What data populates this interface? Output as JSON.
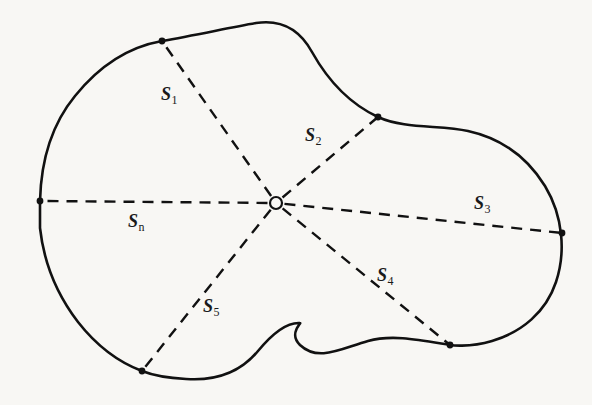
{
  "figure": {
    "background_color": "#f8f7f4",
    "outline_color": "#111111",
    "dash_color": "#111111",
    "label_color": "#1a1a1a",
    "center_point": {
      "x": 276,
      "y": 203,
      "radius": 6,
      "fill": "#f8f7f4",
      "stroke": "#111111"
    },
    "outline_path": "M 40 201 C 41 160 52 124 75 96 C 100 65 128 47 162 41 C 196 35 228 28 256 23 C 282 19 300 30 312 52 C 326 77 348 103 378 117 C 404 129 440 125 468 131 C 500 138 527 157 545 186 C 563 216 566 252 556 282 C 546 312 522 332 492 341 C 468 348 450 345 450 345 C 420 340 392 334 368 341 C 340 349 318 362 300 345 C 288 333 302 323 300 323 C 286 322 272 334 258 351 C 240 373 214 381 186 379 C 168 378 152 375 142 371 C 118 362 96 345 78 322 C 58 296 44 264 40 228 Z",
    "segments": [
      {
        "id": "s1",
        "label_symbol": "S",
        "label_subscript": "1",
        "subscript_italic": false,
        "end_x": 162,
        "end_y": 41,
        "label_x": 161,
        "label_y": 85,
        "dot": true
      },
      {
        "id": "s2",
        "label_symbol": "S",
        "label_subscript": "2",
        "subscript_italic": false,
        "end_x": 378,
        "end_y": 117,
        "label_x": 305,
        "label_y": 126,
        "dot": true
      },
      {
        "id": "s3",
        "label_symbol": "S",
        "label_subscript": "3",
        "subscript_italic": false,
        "end_x": 562,
        "end_y": 233,
        "label_x": 474,
        "label_y": 194,
        "dot": true
      },
      {
        "id": "s4",
        "label_symbol": "S",
        "label_subscript": "4",
        "subscript_italic": false,
        "end_x": 450,
        "end_y": 345,
        "label_x": 377,
        "label_y": 266,
        "dot": true
      },
      {
        "id": "s5",
        "label_symbol": "S",
        "label_subscript": "5",
        "subscript_italic": false,
        "end_x": 142,
        "end_y": 371,
        "label_x": 203,
        "label_y": 297,
        "dot": true
      },
      {
        "id": "sn",
        "label_symbol": "S",
        "label_subscript": "n",
        "subscript_italic": false,
        "end_x": 40,
        "end_y": 201,
        "label_x": 128,
        "label_y": 212,
        "dot": true
      }
    ]
  }
}
